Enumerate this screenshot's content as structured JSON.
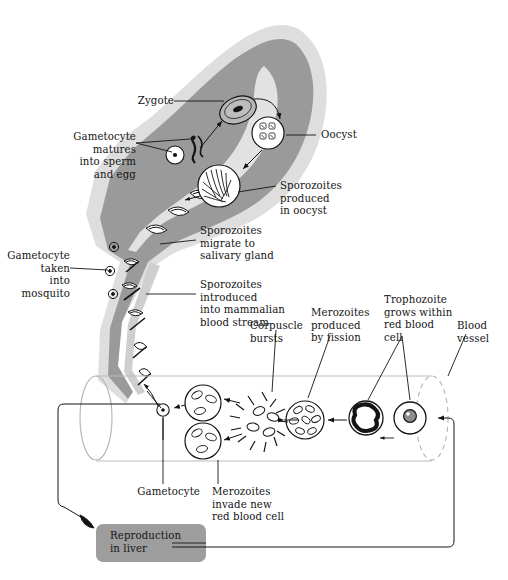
{
  "figure": {
    "domain": "malaria-life-cycle-diagram",
    "background_color": "#ffffff",
    "ink_color": "#141414",
    "mosquito_body_color": "#9a9a9a",
    "mosquito_halo_color": "#dcdcdc",
    "vessel_color": "#b9b9b9",
    "liver_box_color": "#9d9d9d"
  },
  "top_partial_text": "",
  "labels": {
    "zygote": "Zygote",
    "gametocyte_matures": "Gametocyte\nmatures\ninto sperm\nand egg",
    "gametocyte_taken": "Gametocyte\ntaken\ninto\nmosquito",
    "oocyst": "Oocyst",
    "sporozoites_produced": "Sporozoites\nproduced\nin oocyst",
    "sporozoites_migrate": "Sporozoites\nmigrate to\nsalivary gland",
    "sporozoites_introduced": "Sporozoites\nintroduced\ninto mammalian\nblood stream",
    "corpuscle_bursts": "Corpuscle\nbursts",
    "merozoites_produced": "Merozoites\nproduced\nby fission",
    "trophozoite_grows": "Trophozoite\ngrows within\nred blood\ncell",
    "blood_vessel": "Blood\nvessel",
    "gametocyte": "Gametocyte",
    "merozoites_invade": "Merozoites\ninvade new\nred blood cell",
    "reproduction_in_liver": "Reproduction\nin liver"
  },
  "stages": [
    {
      "id": "gametocyte-taken-into-mosquito",
      "label": "Gametocyte taken into mosquito",
      "location": "mosquito-proboscis"
    },
    {
      "id": "gametocyte-matures",
      "label": "Gametocyte matures into sperm and egg",
      "location": "mosquito-gut"
    },
    {
      "id": "zygote",
      "label": "Zygote",
      "location": "mosquito-gut"
    },
    {
      "id": "oocyst",
      "label": "Oocyst",
      "location": "mosquito-gut-wall"
    },
    {
      "id": "sporozoites-produced-in-oocyst",
      "label": "Sporozoites produced in oocyst",
      "location": "mosquito-gut-wall"
    },
    {
      "id": "sporozoites-migrate-to-salivary-gland",
      "label": "Sporozoites migrate to salivary gland",
      "location": "mosquito-thorax"
    },
    {
      "id": "sporozoites-introduced",
      "label": "Sporozoites introduced into mammalian blood stream",
      "location": "mosquito-proboscis"
    },
    {
      "id": "reproduction-in-liver",
      "label": "Reproduction in liver",
      "location": "liver"
    },
    {
      "id": "trophozoite",
      "label": "Trophozoite grows within red blood cell",
      "location": "blood-vessel"
    },
    {
      "id": "merozoites-produced-by-fission",
      "label": "Merozoites produced by fission",
      "location": "blood-vessel"
    },
    {
      "id": "corpuscle-bursts",
      "label": "Corpuscle bursts",
      "location": "blood-vessel"
    },
    {
      "id": "merozoites-invade-new-rbc",
      "label": "Merozoites invade new red blood cell",
      "location": "blood-vessel"
    },
    {
      "id": "gametocyte",
      "label": "Gametocyte",
      "location": "blood-vessel"
    }
  ]
}
